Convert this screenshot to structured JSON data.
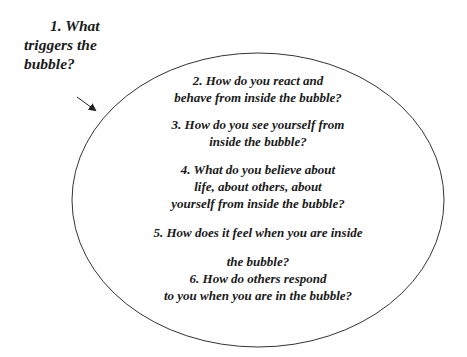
{
  "diagram": {
    "title_label": {
      "line1": "1. What",
      "line2": "triggers the",
      "line3": "bubble?"
    },
    "questions": [
      {
        "lines": [
          "2. How do you react and",
          "behave from inside the bubble?"
        ]
      },
      {
        "lines": [
          "3. How do you see yourself from",
          "inside the bubble?"
        ]
      },
      {
        "lines": [
          "4. What do you believe about",
          "life, about others, about",
          "yourself from inside the bubble?"
        ]
      },
      {
        "lines": [
          "5. How does it feel when you are inside"
        ]
      },
      {
        "lines": [
          "the bubble?",
          "6. How do others respond",
          "to you when you are in the bubble?"
        ]
      }
    ],
    "shape": "ellipse",
    "arrow": "arrow-pointing-to-bubble",
    "colors": {
      "stroke": "#333333",
      "text": "#1a1a1a",
      "background": "#ffffff"
    }
  }
}
